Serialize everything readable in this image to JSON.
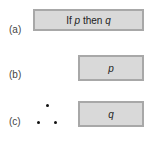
{
  "rows": [
    {
      "label": "(a)",
      "box": {
        "prefix": "If ",
        "var1": "p",
        "middle": " then ",
        "var2": "q"
      }
    },
    {
      "label": "(b)",
      "box": {
        "var": "p"
      }
    },
    {
      "label": "(c)",
      "box": {
        "var": "q"
      },
      "therefore_symbol": "∴"
    }
  ]
}
